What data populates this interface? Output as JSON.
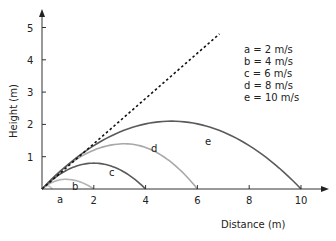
{
  "chart_data": {
    "type": "line",
    "title": "",
    "xlabel": "Distance (m)",
    "ylabel": "Height (m)",
    "xlim": [
      0,
      11
    ],
    "ylim": [
      0,
      5.5
    ],
    "xticks": [
      2,
      4,
      6,
      8,
      10
    ],
    "yticks": [
      1,
      2,
      3,
      4,
      5
    ],
    "grid": false,
    "legend_position": "top-right",
    "legend": [
      "a = 2 m/s",
      "b = 4 m/s",
      "c = 6 m/s",
      "d = 8 m/s",
      "e = 10 m/s"
    ],
    "series": [
      {
        "name": "a",
        "label": "a = 2 m/s",
        "speed_m_s": 2,
        "range_m": 0.4,
        "max_height_m": 0.1,
        "peak_x_m": 0.2,
        "color": "#c8c8c8",
        "style": "solid"
      },
      {
        "name": "b",
        "label": "b = 4 m/s",
        "speed_m_s": 4,
        "range_m": 2,
        "max_height_m": 0.3,
        "peak_x_m": 0.9,
        "color": "#b4b4b4",
        "style": "solid"
      },
      {
        "name": "c",
        "label": "c = 6 m/s",
        "speed_m_s": 6,
        "range_m": 4,
        "max_height_m": 0.8,
        "peak_x_m": 2.0,
        "color": "#5a5a5a",
        "style": "solid"
      },
      {
        "name": "d",
        "label": "d = 8 m/s",
        "speed_m_s": 8,
        "range_m": 6,
        "max_height_m": 1.4,
        "peak_x_m": 3.2,
        "color": "#a8a8a8",
        "style": "solid"
      },
      {
        "name": "e",
        "label": "e = 10 m/s",
        "speed_m_s": 10,
        "range_m": 10,
        "max_height_m": 2.1,
        "peak_x_m": 5.0,
        "color": "#5a5a5a",
        "style": "solid"
      },
      {
        "name": "launch-direction",
        "label": "",
        "x": [
          0,
          6.85
        ],
        "y": [
          0,
          4.8
        ],
        "color": "#111111",
        "style": "dashed"
      }
    ],
    "annotations": [
      {
        "text": "a",
        "x": 0.8,
        "y": -0.45
      },
      {
        "text": "b",
        "x": 1.3,
        "y": 0.1
      },
      {
        "text": "c",
        "x": 2.7,
        "y": 0.5
      },
      {
        "text": "d",
        "x": 4.3,
        "y": 1.3
      },
      {
        "text": "e",
        "x": 6.3,
        "y": 1.5
      }
    ]
  },
  "labels": {
    "xlabel": "Distance (m)",
    "ylabel": "Height (m)",
    "xticks": [
      "2",
      "4",
      "6",
      "8",
      "10"
    ],
    "yticks": [
      "1",
      "2",
      "3",
      "4",
      "5"
    ],
    "legend": [
      "a = 2 m/s",
      "b = 4 m/s",
      "c = 6 m/s",
      "d = 8 m/s",
      "e = 10 m/s"
    ],
    "curve_labels": [
      "a",
      "b",
      "c",
      "d",
      "e"
    ]
  }
}
